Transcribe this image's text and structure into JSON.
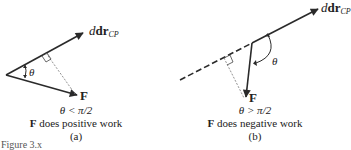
{
  "figure": {
    "partial_caption": "Figure 3.x",
    "panels": [
      {
        "id": "a",
        "vector_dr": {
          "symbol": "dr",
          "subscript": "CP"
        },
        "vector_F": {
          "symbol": "F"
        },
        "angle_symbol": "θ",
        "condition": "θ < π/2",
        "description": {
          "bold": "F",
          "text": " does positive work"
        },
        "label": "(a)"
      },
      {
        "id": "b",
        "vector_dr": {
          "symbol": "dr",
          "subscript": "CP"
        },
        "vector_F": {
          "symbol": "F"
        },
        "angle_symbol": "θ",
        "condition": "θ > π/2",
        "description": {
          "bold": "F",
          "text": " does negative work"
        },
        "label": "(b)"
      }
    ]
  },
  "colors": {
    "line": "#2a2a2a",
    "dashed_projection": "#777777"
  }
}
